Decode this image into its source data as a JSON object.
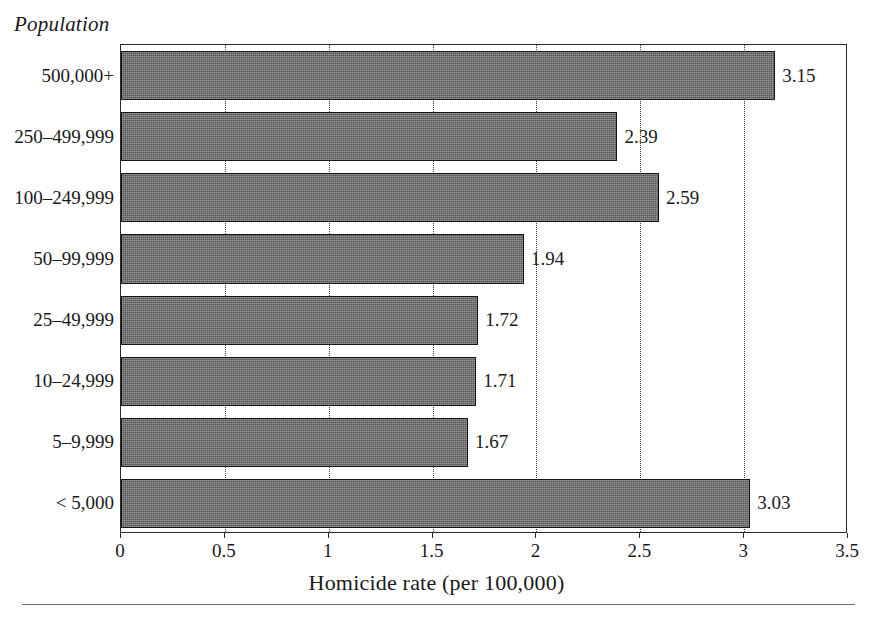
{
  "chart_data": {
    "type": "bar",
    "orientation": "horizontal",
    "title": "",
    "group_label": "Population",
    "xlabel": "Homicide rate (per 100,000)",
    "ylabel": "Population",
    "categories": [
      "500,000+",
      "250–499,999",
      "100–249,999",
      "50–99,999",
      "25–49,999",
      "10–24,999",
      "5–9,999",
      "< 5,000"
    ],
    "values": [
      3.15,
      2.39,
      2.59,
      1.94,
      1.72,
      1.71,
      1.67,
      3.03
    ],
    "value_labels": [
      "3.15",
      "2.39",
      "2.59",
      "1.94",
      "1.72",
      "1.71",
      "1.67",
      "3.03"
    ],
    "xlim": [
      0,
      3.5
    ],
    "xticks": [
      0,
      0.5,
      1,
      1.5,
      2,
      2.5,
      3,
      3.5
    ],
    "xtick_labels": [
      "0",
      "0.5",
      "1",
      "1.5",
      "2",
      "2.5",
      "3",
      "3.5"
    ],
    "grid": true,
    "grid_axis": "x",
    "grid_style": "dotted",
    "legend": false,
    "bar_color": "#6d6d6d",
    "bar_edge_color": "#151515",
    "frame_color": "#2a2a2a",
    "background": "#ffffff"
  }
}
